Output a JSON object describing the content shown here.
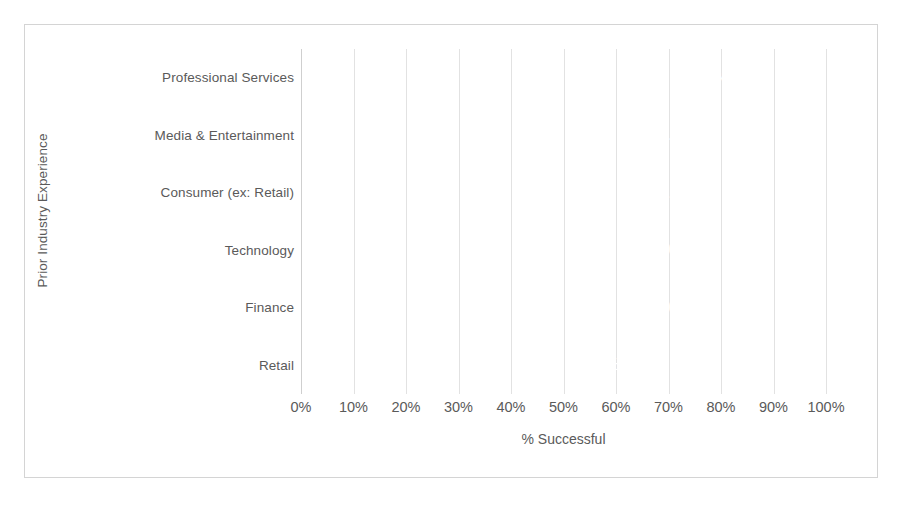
{
  "chart_data": {
    "type": "bar",
    "orientation": "horizontal",
    "title": "",
    "xlabel": "% Successful",
    "ylabel": "Prior Industry Experience",
    "categories": [
      "Professional Services",
      "Media & Entertainment",
      "Consumer (ex: Retail)",
      "Technology",
      "Finance",
      "Retail"
    ],
    "values": [
      83.5,
      77.1,
      76.7,
      75.0,
      75.0,
      62.5
    ],
    "data_labels": [
      "83.5%",
      "77.1%",
      "76.7%",
      "75.0%",
      "75.0%",
      "62.5%"
    ],
    "xlim": [
      0,
      100
    ],
    "xticks": [
      0,
      10,
      20,
      30,
      40,
      50,
      60,
      70,
      80,
      90,
      100
    ],
    "xtick_labels": [
      "0%",
      "10%",
      "20%",
      "30%",
      "40%",
      "50%",
      "60%",
      "70%",
      "80%",
      "90%",
      "100%"
    ],
    "grid": "vertical",
    "legend": "none",
    "colors": {
      "bar": "#808080",
      "data_label_text": "#ffffff",
      "axis_text": "#5a5a5a",
      "gridline": "#e2e2e2",
      "axis_line": "#cfcfcf",
      "frame_border": "#d4d4d4",
      "background": "#ffffff"
    }
  }
}
